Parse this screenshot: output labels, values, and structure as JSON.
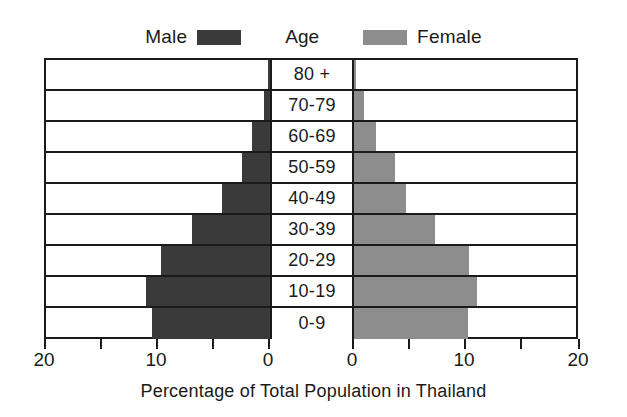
{
  "legend": {
    "male_label": "Male",
    "center_label": "Age",
    "female_label": "Female",
    "male_color": "#3a3a3a",
    "female_color": "#8d8d8d"
  },
  "axis": {
    "title": "Percentage of Total Population in Thailand",
    "tick_labels": [
      "20",
      "10",
      "0",
      "0",
      "10",
      "20"
    ]
  },
  "chart_data": {
    "type": "bar",
    "subtype": "population-pyramid",
    "title": "",
    "xlabel": "Percentage of Total Population in Thailand",
    "ylabel": "Age",
    "categories": [
      "80 +",
      "70-79",
      "60-69",
      "50-59",
      "40-49",
      "30-39",
      "20-29",
      "10-19",
      "0-9"
    ],
    "xlim_left": [
      20,
      0
    ],
    "xlim_right": [
      0,
      20
    ],
    "xticks_left": [
      20,
      10,
      0
    ],
    "xticks_right": [
      0,
      10,
      20
    ],
    "grid": false,
    "legend_position": "top",
    "series": [
      {
        "name": "Male",
        "side": "left",
        "color": "#3a3a3a",
        "values": [
          0.2,
          0.5,
          1.6,
          2.5,
          4.3,
          7.0,
          9.7,
          11.1,
          10.5
        ]
      },
      {
        "name": "Female",
        "side": "right",
        "color": "#8d8d8d",
        "values": [
          0.2,
          0.9,
          2.0,
          3.7,
          4.6,
          7.2,
          10.3,
          11.0,
          10.2
        ]
      }
    ]
  },
  "rows": [
    {
      "age": "80 +",
      "male": 0.2,
      "female": 0.2
    },
    {
      "age": "70-79",
      "male": 0.5,
      "female": 0.9
    },
    {
      "age": "60-69",
      "male": 1.6,
      "female": 2.0
    },
    {
      "age": "50-59",
      "male": 2.5,
      "female": 3.7
    },
    {
      "age": "40-49",
      "male": 4.3,
      "female": 4.6
    },
    {
      "age": "30-39",
      "male": 7.0,
      "female": 7.2
    },
    {
      "age": "20-29",
      "male": 9.7,
      "female": 10.3
    },
    {
      "age": "10-19",
      "male": 11.1,
      "female": 11.0
    },
    {
      "age": "0-9",
      "male": 10.5,
      "female": 10.2
    }
  ]
}
